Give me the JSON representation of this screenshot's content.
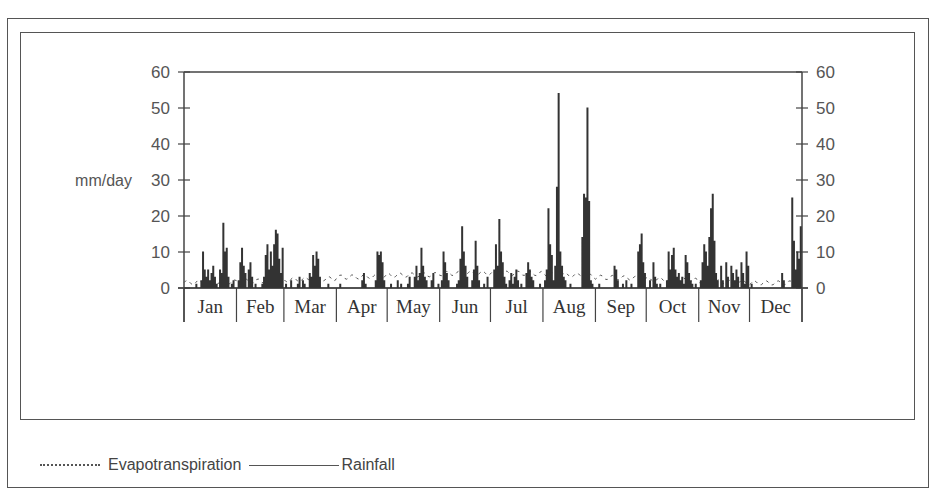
{
  "chart_data": {
    "type": "line",
    "title": "",
    "ylabel": "mm/day",
    "xlabel": "",
    "ylim": [
      0,
      60
    ],
    "yticks": [
      0,
      10,
      20,
      30,
      40,
      50,
      60
    ],
    "secondary_yticks": [
      0,
      10,
      20,
      30,
      40,
      50,
      60
    ],
    "grid": false,
    "legend_position": "bottom-left",
    "categories": [
      "Jan",
      "Feb",
      "Mar",
      "Apr",
      "May",
      "Jun",
      "Jul",
      "Aug",
      "Sep",
      "Oct",
      "Nov",
      "Dec"
    ],
    "month_days": [
      31,
      28,
      31,
      30,
      31,
      30,
      31,
      31,
      30,
      31,
      30,
      31
    ],
    "series": [
      {
        "name": "Evapotranspiration",
        "style": "dotted",
        "monthly_values": [
          1.5,
          1.8,
          2.2,
          3.0,
          3.5,
          4.0,
          4.2,
          3.8,
          3.0,
          2.4,
          1.8,
          1.4
        ]
      },
      {
        "name": "Rainfall",
        "style": "solid",
        "monthly_peaks": [
          18,
          16,
          10,
          4,
          10,
          17,
          19,
          54,
          15,
          10,
          26,
          25
        ],
        "daily_values": [
          0,
          0,
          0,
          0,
          0,
          0,
          0,
          1,
          0,
          0,
          2,
          10,
          5,
          3,
          5,
          2,
          4,
          6,
          3,
          1,
          0,
          5,
          4,
          18,
          10,
          11,
          3,
          0,
          1,
          2,
          0,
          0,
          2,
          7,
          11,
          6,
          4,
          0,
          5,
          7,
          3,
          0,
          1,
          0,
          0,
          0,
          1,
          3,
          9,
          12,
          5,
          10,
          6,
          12,
          16,
          15,
          8,
          4,
          11,
          0,
          1,
          0,
          0,
          2,
          0,
          0,
          0,
          1,
          3,
          0,
          2,
          1,
          0,
          0,
          4,
          3,
          9,
          6,
          10,
          8,
          3,
          0,
          0,
          0,
          0,
          1,
          0,
          0,
          0,
          0,
          0,
          0,
          1,
          0,
          0,
          0,
          0,
          0,
          0,
          0,
          0,
          0,
          0,
          0,
          0,
          2,
          4,
          1,
          0,
          0,
          0,
          0,
          0,
          2,
          10,
          9,
          10,
          7,
          2,
          0,
          0,
          0,
          1,
          0,
          0,
          0,
          2,
          0,
          1,
          0,
          0,
          0,
          1,
          3,
          0,
          0,
          3,
          6,
          2,
          4,
          11,
          6,
          3,
          2,
          0,
          0,
          2,
          4,
          0,
          0,
          1,
          0,
          2,
          10,
          7,
          4,
          2,
          0,
          0,
          0,
          0,
          1,
          2,
          8,
          17,
          10,
          6,
          3,
          0,
          0,
          2,
          5,
          13,
          6,
          2,
          0,
          0,
          1,
          0,
          3,
          0,
          0,
          0,
          5,
          12,
          6,
          19,
          10,
          7,
          3,
          1,
          0,
          2,
          4,
          1,
          3,
          5,
          2,
          0,
          1,
          0,
          0,
          4,
          7,
          5,
          3,
          2,
          0,
          0,
          0,
          1,
          0,
          0,
          2,
          5,
          22,
          12,
          9,
          2,
          6,
          28,
          54,
          10,
          6,
          3,
          2,
          0,
          0,
          1,
          0,
          0,
          0,
          0,
          0,
          0,
          14,
          26,
          25,
          50,
          24,
          2,
          1,
          0,
          0,
          0,
          1,
          0,
          0,
          0,
          0,
          0,
          0,
          0,
          0,
          6,
          5,
          2,
          0,
          0,
          1,
          0,
          2,
          0,
          0,
          1,
          0,
          0,
          0,
          10,
          12,
          15,
          7,
          4,
          0,
          0,
          2,
          0,
          7,
          3,
          1,
          0,
          1,
          0,
          0,
          0,
          2,
          10,
          5,
          9,
          11,
          5,
          3,
          4,
          2,
          3,
          1,
          9,
          7,
          4,
          2,
          1,
          0,
          1,
          0,
          0,
          2,
          7,
          12,
          10,
          6,
          14,
          22,
          26,
          13,
          4,
          2,
          0,
          6,
          2,
          0,
          7,
          3,
          0,
          6,
          4,
          2,
          5,
          3,
          0,
          7,
          4,
          1,
          10,
          6,
          0,
          1,
          0,
          0,
          0,
          0,
          0,
          0,
          0,
          0,
          0,
          0,
          0,
          0,
          0,
          0,
          0,
          0,
          0,
          4,
          2,
          0,
          0,
          0,
          0,
          25,
          13,
          5,
          10,
          8,
          17
        ]
      }
    ]
  },
  "axis": {
    "left_label": "mm/day",
    "ticks": [
      "0",
      "10",
      "20",
      "30",
      "40",
      "50",
      "60"
    ]
  },
  "legend": {
    "evapotranspiration": "Evapotranspiration",
    "rainfall": "Rainfall"
  }
}
